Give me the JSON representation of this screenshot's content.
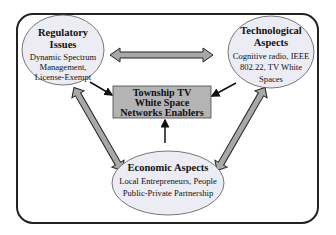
{
  "diagram": {
    "nodes": {
      "regulatory": {
        "title_lines": [
          "Regulatory",
          "Issues"
        ],
        "body_lines": [
          "Dynamic Spectrum",
          "Management,",
          "License-Exempt"
        ]
      },
      "technological": {
        "title_lines": [
          "Technological",
          "Aspects"
        ],
        "body_lines": [
          "Cognitive radio, IEEE",
          "802.22, TV White",
          "Spaces"
        ]
      },
      "economic": {
        "title_lines": [
          "Economic Aspects"
        ],
        "body_lines": [
          "Local Entrepreneurs, People",
          "Public-Private Partnership"
        ]
      },
      "center": {
        "lines": [
          "Township TV",
          "White Space",
          "Networks Enablers"
        ]
      }
    },
    "edges": [
      {
        "from": "regulatory",
        "to": "technological",
        "type": "double-block-arrow"
      },
      {
        "from": "regulatory",
        "to": "economic",
        "type": "double-block-arrow"
      },
      {
        "from": "technological",
        "to": "economic",
        "type": "double-block-arrow"
      },
      {
        "from": "regulatory",
        "to": "center",
        "type": "line-arrow"
      },
      {
        "from": "technological",
        "to": "center",
        "type": "line-arrow"
      },
      {
        "from": "economic",
        "to": "center",
        "type": "line-arrow"
      }
    ],
    "colors": {
      "ellipse_fill": "#ececf4",
      "box_fill": "#b4b4b4",
      "block_arrow_fill": "#a8a8a8",
      "stroke": "#222222"
    }
  }
}
